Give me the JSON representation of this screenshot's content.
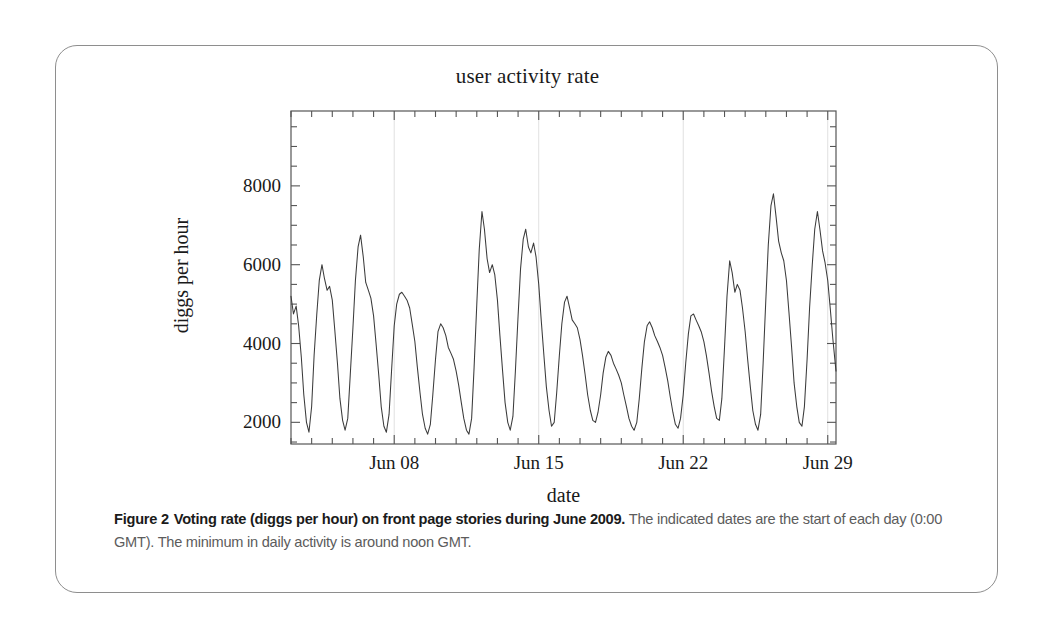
{
  "figure": {
    "caption_label": "Figure 2",
    "caption_bold": "Voting rate (diggs per hour) on front page stories during June 2009.",
    "caption_rest": "The indicated dates are the start of each day (0:00 GMT). The minimum in daily activity is around noon GMT."
  },
  "chart_data": {
    "type": "line",
    "title": "user activity rate",
    "xlabel": "date",
    "ylabel": "diggs per hour",
    "grid": "faint vertical gridlines at labeled date ticks",
    "legend": "none",
    "line_color": "#3b3b3b",
    "frame_color": "#555555",
    "xlim": [
      3.0,
      29.4
    ],
    "ylim": [
      1450,
      9900
    ],
    "yticks": [
      2000,
      4000,
      6000,
      8000
    ],
    "ytick_labels": [
      "2000",
      "4000",
      "6000",
      "8000"
    ],
    "xticks": [
      8,
      15,
      22,
      29
    ],
    "xtick_labels": [
      "Jun 08",
      "Jun 15",
      "Jun 22",
      "Jun 29"
    ],
    "x_minor_tick_interval_days": 1,
    "x_unit": "day of June 2009 (fractional, 0:00 GMT = integer)",
    "y_unit": "diggs per hour",
    "series_name": "diggs per hour",
    "x": [
      3.0,
      3.12,
      3.25,
      3.37,
      3.5,
      3.62,
      3.75,
      3.87,
      4.0,
      4.12,
      4.25,
      4.37,
      4.5,
      4.62,
      4.75,
      4.87,
      5.0,
      5.12,
      5.25,
      5.37,
      5.5,
      5.62,
      5.75,
      5.87,
      6.0,
      6.12,
      6.25,
      6.37,
      6.5,
      6.62,
      6.75,
      6.87,
      7.0,
      7.12,
      7.25,
      7.37,
      7.5,
      7.62,
      7.75,
      7.87,
      8.0,
      8.12,
      8.25,
      8.37,
      8.5,
      8.62,
      8.75,
      8.87,
      9.0,
      9.12,
      9.25,
      9.37,
      9.5,
      9.62,
      9.75,
      9.87,
      10.0,
      10.12,
      10.25,
      10.37,
      10.5,
      10.62,
      10.75,
      10.87,
      11.0,
      11.12,
      11.25,
      11.37,
      11.5,
      11.62,
      11.75,
      11.87,
      12.0,
      12.12,
      12.25,
      12.37,
      12.5,
      12.62,
      12.75,
      12.87,
      13.0,
      13.12,
      13.25,
      13.37,
      13.5,
      13.62,
      13.75,
      13.87,
      14.0,
      14.12,
      14.25,
      14.37,
      14.5,
      14.62,
      14.75,
      14.87,
      15.0,
      15.12,
      15.25,
      15.37,
      15.5,
      15.62,
      15.75,
      15.87,
      16.0,
      16.12,
      16.25,
      16.37,
      16.5,
      16.62,
      16.75,
      16.87,
      17.0,
      17.12,
      17.25,
      17.37,
      17.5,
      17.62,
      17.75,
      17.87,
      18.0,
      18.12,
      18.25,
      18.37,
      18.5,
      18.62,
      18.75,
      18.87,
      19.0,
      19.12,
      19.25,
      19.37,
      19.5,
      19.62,
      19.75,
      19.87,
      20.0,
      20.12,
      20.25,
      20.37,
      20.5,
      20.62,
      20.75,
      20.87,
      21.0,
      21.12,
      21.25,
      21.37,
      21.5,
      21.62,
      21.75,
      21.87,
      22.0,
      22.12,
      22.25,
      22.37,
      22.5,
      22.62,
      22.75,
      22.87,
      23.0,
      23.12,
      23.25,
      23.37,
      23.5,
      23.62,
      23.75,
      23.87,
      24.0,
      24.12,
      24.25,
      24.37,
      24.5,
      24.62,
      24.75,
      24.87,
      25.0,
      25.12,
      25.25,
      25.37,
      25.5,
      25.62,
      25.75,
      25.87,
      26.0,
      26.12,
      26.25,
      26.37,
      26.5,
      26.62,
      26.75,
      26.87,
      27.0,
      27.12,
      27.25,
      27.37,
      27.5,
      27.62,
      27.75,
      27.87,
      28.0,
      28.12,
      28.25,
      28.37,
      28.5,
      28.62,
      28.75,
      28.87,
      29.0,
      29.12,
      29.25,
      29.4
    ],
    "values": [
      5200,
      4750,
      4950,
      4450,
      3650,
      2700,
      2000,
      1750,
      2400,
      3700,
      4750,
      5600,
      6000,
      5650,
      5350,
      5450,
      5100,
      4350,
      3500,
      2600,
      2050,
      1800,
      2100,
      3200,
      4400,
      5600,
      6450,
      6750,
      6200,
      5550,
      5350,
      5150,
      4700,
      4000,
      3200,
      2400,
      1900,
      1750,
      2200,
      3300,
      4450,
      5000,
      5250,
      5300,
      5200,
      5100,
      4900,
      4500,
      4050,
      3400,
      2750,
      2200,
      1850,
      1700,
      1950,
      2700,
      3600,
      4300,
      4500,
      4400,
      4200,
      3900,
      3750,
      3600,
      3300,
      2950,
      2500,
      2100,
      1800,
      1700,
      2100,
      3400,
      5000,
      6400,
      7350,
      6900,
      6150,
      5800,
      6000,
      5750,
      5100,
      4200,
      3300,
      2500,
      2000,
      1800,
      2150,
      3300,
      4700,
      5900,
      6650,
      6900,
      6450,
      6300,
      6550,
      6200,
      5500,
      4600,
      3700,
      2900,
      2300,
      1900,
      2000,
      2750,
      3700,
      4500,
      5050,
      5200,
      4900,
      4600,
      4500,
      4400,
      4100,
      3700,
      3200,
      2700,
      2300,
      2050,
      2000,
      2250,
      2700,
      3250,
      3650,
      3800,
      3700,
      3500,
      3350,
      3200,
      3000,
      2700,
      2400,
      2100,
      1900,
      1800,
      2000,
      2600,
      3400,
      4050,
      4450,
      4550,
      4400,
      4200,
      4050,
      3900,
      3700,
      3400,
      3050,
      2650,
      2250,
      1950,
      1850,
      2100,
      2700,
      3500,
      4250,
      4700,
      4750,
      4600,
      4450,
      4300,
      4050,
      3700,
      3250,
      2800,
      2400,
      2100,
      2050,
      2600,
      3900,
      5200,
      6100,
      5800,
      5300,
      5500,
      5350,
      4900,
      4300,
      3600,
      2900,
      2300,
      1950,
      1800,
      2200,
      3500,
      5100,
      6500,
      7500,
      7800,
      7200,
      6600,
      6300,
      6100,
      5600,
      4800,
      3900,
      3000,
      2400,
      2000,
      1900,
      2400,
      3600,
      4900,
      6000,
      6900,
      7350,
      6900,
      6350,
      6050,
      5600,
      4900,
      4100,
      3300
    ]
  }
}
